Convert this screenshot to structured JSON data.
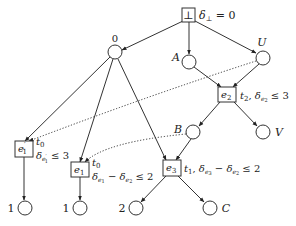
{
  "diagram": {
    "type": "tree with event boxes and dotted cross-links",
    "root": {
      "symbol": "⊥",
      "annotation": "δ⊥ = 0"
    },
    "nodes": {
      "zero": {
        "label": "0"
      },
      "A": {
        "label": "A"
      },
      "U": {
        "label": "U"
      },
      "B": {
        "label": "B"
      },
      "V": {
        "label": "V"
      },
      "one_left": {
        "label": "1"
      },
      "one_mid": {
        "label": "1"
      },
      "two": {
        "label": "2"
      },
      "C": {
        "label": "C"
      }
    },
    "events": {
      "e1prime": {
        "name": "e′1",
        "base": "e",
        "sup": "′",
        "sub": "1",
        "ann_t": "t0",
        "ann_t_base": "t",
        "ann_t_sub": "0",
        "ann_delta": "δe′1 ≤ 3"
      },
      "e1": {
        "name": "e1",
        "base": "e",
        "sub": "1",
        "ann_t": "t0",
        "ann_t_base": "t",
        "ann_t_sub": "0",
        "ann_delta": "δe1 − δe2 ≤ 2"
      },
      "e2": {
        "name": "e2",
        "base": "e",
        "sub": "2",
        "ann": "t2, δe2 ≤ 3"
      },
      "e3": {
        "name": "e3",
        "base": "e",
        "sub": "3",
        "ann": "t1, δe3 − δe2 ≤ 2"
      }
    },
    "text": {
      "delta": "δ",
      "bot_sub": "⊥",
      "eq0": " = 0",
      "le3": " ≤ 3",
      "le2": " ≤ 2",
      "minus": " − ",
      "comma": ", ",
      "t": "t",
      "e": "e",
      "sub0": "0",
      "sub1": "1",
      "sub2": "2",
      "sub3": "3",
      "prime": "′"
    },
    "edges": [
      {
        "from": "⊥",
        "to": "0",
        "style": "solid-arrow"
      },
      {
        "from": "⊥",
        "to": "A",
        "style": "solid-arrow"
      },
      {
        "from": "⊥",
        "to": "U",
        "style": "solid-arrow"
      },
      {
        "from": "A",
        "to": "e2",
        "style": "solid-arrow"
      },
      {
        "from": "U",
        "to": "e2",
        "style": "solid-arrow"
      },
      {
        "from": "e2",
        "to": "B",
        "style": "solid-arrow"
      },
      {
        "from": "e2",
        "to": "V",
        "style": "solid-arrow"
      },
      {
        "from": "0",
        "to": "e′1",
        "style": "solid-arrow"
      },
      {
        "from": "0",
        "to": "e1",
        "style": "solid-arrow"
      },
      {
        "from": "0",
        "to": "e3",
        "style": "solid-arrow"
      },
      {
        "from": "B",
        "to": "e3",
        "style": "solid-arrow"
      },
      {
        "from": "e′1",
        "to": "1",
        "style": "solid-arrow"
      },
      {
        "from": "e1",
        "to": "1",
        "style": "solid-arrow"
      },
      {
        "from": "e3",
        "to": "2",
        "style": "solid-arrow"
      },
      {
        "from": "e3",
        "to": "C",
        "style": "solid-arrow"
      },
      {
        "from": "U",
        "to": "e′1",
        "style": "dotted-arrow"
      },
      {
        "from": "B",
        "to": "e1",
        "style": "dotted-arrow"
      }
    ]
  }
}
